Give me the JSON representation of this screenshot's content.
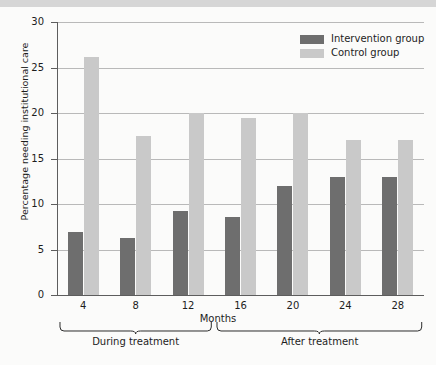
{
  "chart_data": {
    "type": "bar",
    "title": "",
    "xlabel": "Months",
    "ylabel": "Percentage needing institutional care",
    "categories": [
      "4",
      "8",
      "12",
      "16",
      "20",
      "24",
      "28"
    ],
    "series": [
      {
        "name": "Intervention group",
        "color": "#6e6e6e",
        "values": [
          6.9,
          6.3,
          9.2,
          8.6,
          12.0,
          13.0,
          13.0
        ]
      },
      {
        "name": "Control group",
        "color": "#c9c9c9",
        "values": [
          26.2,
          17.5,
          20.0,
          19.5,
          20.0,
          17.0,
          17.0
        ]
      }
    ],
    "ylim": [
      0,
      30
    ],
    "yticks": [
      0,
      5,
      10,
      15,
      20,
      25,
      30
    ],
    "ytick_labels": [
      "0",
      "5",
      "10",
      "15",
      "20",
      "25",
      "30"
    ],
    "grid": true,
    "legend_position": "top-right",
    "annotations": [
      {
        "label": "During treatment",
        "spans": [
          "4",
          "8",
          "12"
        ]
      },
      {
        "label": "After treatment",
        "spans": [
          "16",
          "20",
          "24",
          "28"
        ]
      }
    ]
  },
  "legend": {
    "items": [
      {
        "label": "Intervention group"
      },
      {
        "label": "Control group"
      }
    ]
  },
  "axes": {
    "y_title": "Percentage needing institutional care",
    "x_title": "Months"
  },
  "braces": {
    "during": "During treatment",
    "after": "After treatment"
  }
}
